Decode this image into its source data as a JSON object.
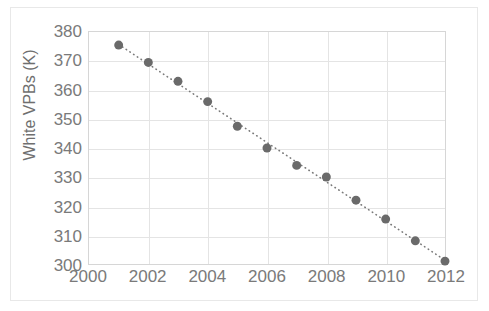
{
  "chart_data": {
    "type": "scatter",
    "title": "",
    "xlabel": "",
    "ylabel": "White VPBs (K)",
    "x": [
      2001,
      2002,
      2003,
      2004,
      2005,
      2006,
      2007,
      2008,
      2009,
      2010,
      2011,
      2012
    ],
    "values": [
      375.5,
      369.5,
      363.0,
      356.0,
      347.5,
      340.0,
      334.0,
      330.0,
      322.0,
      315.5,
      308.0,
      301.0
    ],
    "series": [
      {
        "name": "White VPBs (K)",
        "values": [
          375.5,
          369.5,
          363.0,
          356.0,
          347.5,
          340.0,
          334.0,
          330.0,
          322.0,
          315.5,
          308.0,
          301.0
        ]
      }
    ],
    "xlim": [
      2000,
      2012
    ],
    "ylim": [
      300,
      380
    ],
    "xticks": [
      2000,
      2002,
      2004,
      2006,
      2008,
      2010,
      2012
    ],
    "xtick_labels": [
      "2000",
      "2002",
      "2004",
      "2006",
      "2008",
      "2010",
      "2012"
    ],
    "yticks": [
      300,
      310,
      320,
      330,
      340,
      350,
      360,
      370,
      380
    ],
    "ytick_labels": [
      "300",
      "310",
      "320",
      "330",
      "340",
      "350",
      "360",
      "370",
      "380"
    ],
    "grid": true,
    "legend": false,
    "trendline": {
      "style": "dotted",
      "color": "#7a7a7a"
    },
    "marker": {
      "shape": "circle",
      "color": "#6a6a6a",
      "size": 9
    },
    "colors": {
      "marker": "#6a6a6a",
      "trendline": "#7a7a7a",
      "grid": "#e4e4e4",
      "axis": "#d6d6d6",
      "tick_label": "#7a7a7a",
      "axis_title": "#6f6f6f",
      "background": "#ffffff",
      "frame": "#e8e8e8"
    }
  }
}
